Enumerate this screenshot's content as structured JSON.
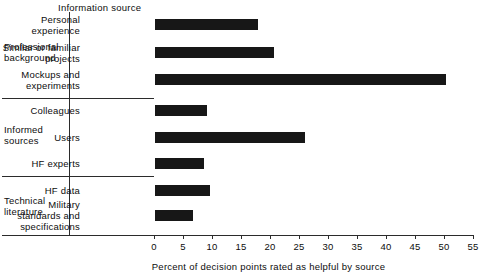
{
  "chart_data": {
    "type": "bar",
    "orientation": "horizontal",
    "title": "",
    "column_header": "Information source",
    "xlabel": "Percent of decision points rated as helpful by source",
    "ylabel": "",
    "xlim": [
      0,
      55
    ],
    "xticks": [
      0,
      5,
      10,
      15,
      20,
      25,
      30,
      35,
      40,
      45,
      50,
      55
    ],
    "xtick_labels": [
      "0",
      "5",
      "10",
      "15",
      "20",
      "25",
      "30",
      "35",
      "40",
      "45",
      "50",
      "55"
    ],
    "grid": false,
    "legend": "none",
    "bar_color": "#171717",
    "axis_color": "#2b2b2b",
    "categories": [
      "Personal experience",
      "Similar or familiar projects",
      "Mockups and experiments",
      "Colleagues",
      "Users",
      "HF experts",
      "HF data",
      "Military standards and specifications"
    ],
    "values": [
      17.8,
      20.6,
      50.2,
      9.0,
      25.8,
      8.5,
      9.5,
      6.6
    ],
    "groups": [
      {
        "name": "Professional background",
        "name_lines": "Professional\nbackground",
        "categories": [
          "Personal experience",
          "Similar or familiar projects",
          "Mockups and experiments"
        ],
        "values": [
          17.8,
          20.6,
          50.2
        ]
      },
      {
        "name": "Informed sources",
        "name_lines": "Informed\nsources",
        "categories": [
          "Colleagues",
          "Users",
          "HF experts"
        ],
        "values": [
          9.0,
          25.8,
          8.5
        ]
      },
      {
        "name": "Technical literature",
        "name_lines": "Technical\nliterature",
        "categories": [
          "HF data",
          "Military standards and specifications"
        ],
        "values": [
          9.5,
          6.6
        ]
      }
    ],
    "bars": [
      {
        "label_lines": "Personal\nexperience",
        "value": 17.8
      },
      {
        "label_lines": "Similar or familiar\nprojects",
        "value": 20.6
      },
      {
        "label_lines": "Mockups and\nexperiments",
        "value": 50.2
      },
      {
        "label_lines": "Colleagues",
        "value": 9.0
      },
      {
        "label_lines": "Users",
        "value": 25.8
      },
      {
        "label_lines": "HF experts",
        "value": 8.5
      },
      {
        "label_lines": "HF data",
        "value": 9.5
      },
      {
        "label_lines": "Military\nstandards and\nspecifications",
        "value": 6.6
      }
    ]
  }
}
